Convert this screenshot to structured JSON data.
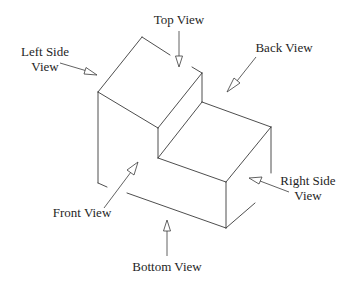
{
  "diagram": {
    "labels": {
      "top_view": "Top View",
      "back_view": "Back View",
      "left_side_line1": "Left Side",
      "left_side_line2": "View",
      "right_side_line1": "Right Side",
      "right_side_line2": "View",
      "front_view": "Front View",
      "bottom_view": "Bottom View"
    },
    "colors": {
      "line": "#3a3a3a",
      "text": "#1f1f1f",
      "background": "#ffffff"
    }
  }
}
